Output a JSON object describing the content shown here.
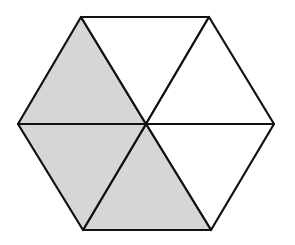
{
  "figure": {
    "shape": "regular hexagon divided into 6 equilateral triangles",
    "total_parts": 6,
    "shaded_parts": 3,
    "shade_color": "#d6d6d6",
    "stroke_color": "#111111",
    "background": "#ffffff",
    "vertices": {
      "top_left": [
        81,
        17
      ],
      "top_right": [
        209,
        17
      ],
      "right": [
        274,
        124
      ],
      "bottom_right": [
        211,
        230
      ],
      "bottom_left": [
        83,
        230
      ],
      "left": [
        18,
        124
      ],
      "center": [
        146,
        124
      ]
    },
    "triangles": [
      {
        "id": "upper-left",
        "shaded": true
      },
      {
        "id": "top",
        "shaded": false
      },
      {
        "id": "upper-right",
        "shaded": false
      },
      {
        "id": "lower-right",
        "shaded": false
      },
      {
        "id": "bottom",
        "shaded": true
      },
      {
        "id": "lower-left",
        "shaded": true
      }
    ]
  }
}
